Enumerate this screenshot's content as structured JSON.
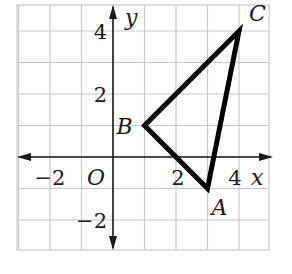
{
  "figure": {
    "type": "coordinate-plane",
    "grid": {
      "x_min": -3,
      "x_max": 5,
      "y_min": -3,
      "y_max": 5,
      "cell_px": 31.5,
      "origin_px": [
        113,
        157
      ],
      "left_px": 17,
      "top_px": 5,
      "right_px": 269,
      "bottom_px": 250,
      "line_color": "#c8c8c8"
    },
    "axes": {
      "x_label": "x",
      "y_label": "y",
      "origin_label": "O",
      "color": "#1a1a1a"
    },
    "tick_labels": {
      "x": [
        {
          "value": -2,
          "text": "−2"
        },
        {
          "value": 2,
          "text": "2"
        },
        {
          "value": 4,
          "text": "4"
        }
      ],
      "y": [
        {
          "value": 4,
          "text": "4"
        },
        {
          "value": 2,
          "text": "2"
        },
        {
          "value": -2,
          "text": "−2"
        }
      ]
    },
    "triangle": {
      "stroke": "#000000",
      "stroke_width": 5,
      "vertices": [
        {
          "name": "A",
          "x": 3,
          "y": -1
        },
        {
          "name": "B",
          "x": 1,
          "y": 1
        },
        {
          "name": "C",
          "x": 4,
          "y": 4
        }
      ]
    }
  }
}
